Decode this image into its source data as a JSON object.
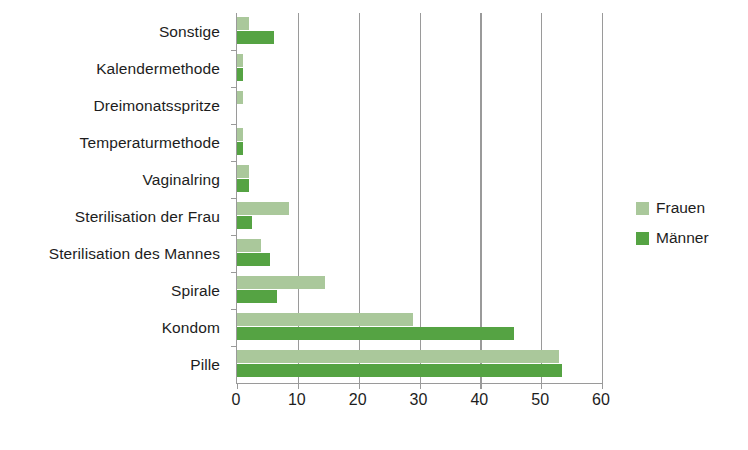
{
  "chart_data": {
    "type": "bar",
    "orientation": "horizontal",
    "title": "",
    "xlabel": "",
    "ylabel": "",
    "xlim": [
      0,
      60
    ],
    "xticks": [
      0,
      10,
      20,
      30,
      40,
      50,
      60
    ],
    "grid": "vertical",
    "legend_position": "right",
    "categories": [
      "Pille",
      "Kondom",
      "Spirale",
      "Sterilisation des Mannes",
      "Sterilisation der Frau",
      "Vaginalring",
      "Temperaturmethode",
      "Dreimonatsspritze",
      "Kalendermethode",
      "Sonstige"
    ],
    "series": [
      {
        "name": "Frauen",
        "color": "#aac89b",
        "values": [
          53,
          29,
          14.5,
          4,
          8.5,
          2,
          1,
          1,
          1,
          2
        ]
      },
      {
        "name": "Männer",
        "color": "#55a343",
        "values": [
          53.5,
          45.5,
          6.5,
          5.5,
          2.5,
          2,
          1,
          0,
          1,
          6
        ]
      }
    ]
  },
  "axis": {
    "x_tick_labels": [
      "0",
      "10",
      "20",
      "30",
      "40",
      "50",
      "60"
    ]
  },
  "legend": {
    "items": [
      {
        "label": "Frauen",
        "color": "#aac89b"
      },
      {
        "label": "Männer",
        "color": "#55a343"
      }
    ]
  },
  "colors": {
    "frauen": "#aac89b",
    "maenner": "#55a343",
    "axis": "#9a9a9a",
    "text": "#1d1d1d",
    "background": "#ffffff"
  }
}
